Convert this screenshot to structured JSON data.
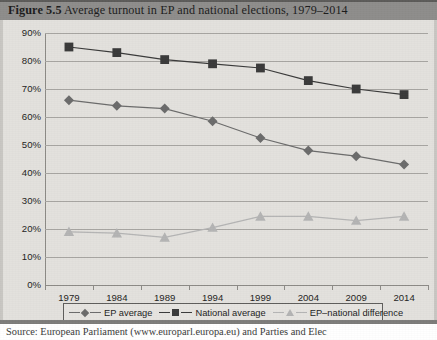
{
  "figure": {
    "number": "Figure 5.5",
    "title": "Average turnout in EP and national elections, 1979–2014",
    "source": "Source: European Parliament (www.europarl.europa.eu) and Parties and Elec"
  },
  "colors": {
    "ep_average": "#6b6b6b",
    "national_average": "#3a3a3a",
    "difference": "#b4b4b4",
    "gridline": "#a8a6a2",
    "header_band": "#8e8d8b",
    "plot_background": "#e3e1dd"
  },
  "legend": {
    "position": "bottom",
    "items": [
      {
        "label": "EP average",
        "marker": "diamond-marker",
        "color": "#6b6b6b"
      },
      {
        "label": "National average",
        "marker": "square-marker",
        "color": "#3a3a3a"
      },
      {
        "label": "EP–national difference",
        "marker": "triangle-marker",
        "color": "#b4b4b4"
      }
    ]
  },
  "chart_data": {
    "type": "line",
    "title": "Average turnout in EP and national elections, 1979–2014",
    "xlabel": "",
    "ylabel": "",
    "categories": [
      "1979",
      "1984",
      "1989",
      "1994",
      "1999",
      "2004",
      "2009",
      "2014"
    ],
    "ytick_labels": [
      "0%",
      "10%",
      "20%",
      "30%",
      "40%",
      "50%",
      "60%",
      "70%",
      "80%",
      "90%"
    ],
    "ytick_values": [
      0,
      10,
      20,
      30,
      40,
      50,
      60,
      70,
      80,
      90
    ],
    "ylim": [
      0,
      90
    ],
    "grid": true,
    "series": [
      {
        "name": "EP average",
        "marker": "diamond",
        "color": "#6b6b6b",
        "values": [
          66,
          64,
          63,
          58.5,
          52.5,
          48,
          46,
          43
        ]
      },
      {
        "name": "National average",
        "marker": "square",
        "color": "#3a3a3a",
        "values": [
          85,
          83,
          80.5,
          79,
          77.5,
          73,
          70,
          68
        ]
      },
      {
        "name": "EP–national difference",
        "marker": "triangle",
        "color": "#b4b4b4",
        "values": [
          19,
          18.5,
          17,
          20.5,
          24.5,
          24.5,
          23,
          24.5
        ]
      }
    ]
  }
}
